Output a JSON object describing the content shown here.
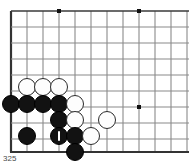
{
  "figure": {
    "caption": "325",
    "type": "go-board-diagram",
    "board": {
      "origin_x": 11,
      "origin_y": 11,
      "spacing": 16,
      "cols": 12,
      "rows": 9,
      "bottom_edge_y": 152,
      "line_color": "#8a8a8a",
      "edge_color": "#333333",
      "major_line_color": "#3a3a3a",
      "background": "#ffffff",
      "star_points": [
        {
          "cx": 59,
          "cy": 11
        },
        {
          "cx": 139,
          "cy": 11
        },
        {
          "cx": 139,
          "cy": 107
        }
      ]
    },
    "stone_radius": 9,
    "stones": [
      {
        "color": "white",
        "cx": 27,
        "cy": 87,
        "label": "",
        "marked": false
      },
      {
        "color": "white",
        "cx": 43,
        "cy": 87,
        "label": "",
        "marked": false
      },
      {
        "color": "white",
        "cx": 59,
        "cy": 87,
        "label": "",
        "marked": false
      },
      {
        "color": "black",
        "cx": 11,
        "cy": 104,
        "label": "",
        "marked": false
      },
      {
        "color": "black",
        "cx": 27,
        "cy": 104,
        "label": "",
        "marked": false
      },
      {
        "color": "black",
        "cx": 43,
        "cy": 104,
        "label": "",
        "marked": false
      },
      {
        "color": "black",
        "cx": 59,
        "cy": 104,
        "label": "",
        "marked": false
      },
      {
        "color": "white",
        "cx": 75,
        "cy": 104,
        "label": "",
        "marked": false
      },
      {
        "color": "black",
        "cx": 59,
        "cy": 120,
        "label": "",
        "marked": false
      },
      {
        "color": "white",
        "cx": 75,
        "cy": 120,
        "label": "",
        "marked": false
      },
      {
        "color": "white",
        "cx": 107,
        "cy": 120,
        "label": "",
        "marked": false
      },
      {
        "color": "black",
        "cx": 27,
        "cy": 136,
        "label": "",
        "marked": false
      },
      {
        "color": "black",
        "cx": 59,
        "cy": 136,
        "label": "",
        "marked": true
      },
      {
        "color": "black",
        "cx": 75,
        "cy": 136,
        "label": "",
        "marked": false
      },
      {
        "color": "white",
        "cx": 91,
        "cy": 136,
        "label": "",
        "marked": false
      },
      {
        "color": "black",
        "cx": 75,
        "cy": 152,
        "label": "",
        "marked": false
      }
    ]
  }
}
